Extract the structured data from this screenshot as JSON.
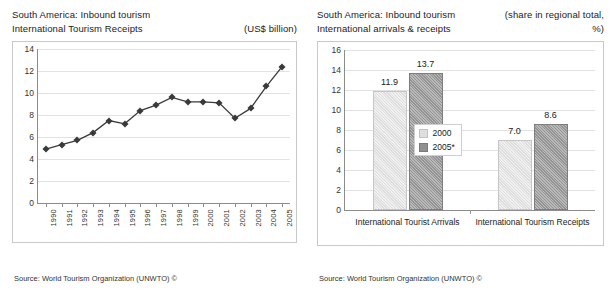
{
  "left_panel": {
    "title_line1": "South America: Inbound tourism",
    "title_line2": "International Tourism Receipts",
    "unit_note": "(US$ billion)",
    "source": "Source: World Tourism Organization (UNWTO) ©"
  },
  "right_panel": {
    "title_line1": "South America: Inbound tourism",
    "title_line2": "International arrivals & receipts",
    "unit_note_line1": "(share in regional total,",
    "unit_note_line2": "%)",
    "source": "Source: World Tourism Organization (UNWTO) ©"
  },
  "chart_data": [
    {
      "type": "line",
      "title": "South America: Inbound tourism — International Tourism Receipts",
      "xlabel": "",
      "ylabel": "US$ billion",
      "ylim": [
        0,
        14
      ],
      "yticks": [
        0,
        2,
        4,
        6,
        8,
        10,
        12,
        14
      ],
      "grid": true,
      "legend": "none",
      "categories": [
        "1990",
        "1991",
        "1992",
        "1993",
        "1994",
        "1995",
        "1996",
        "1997",
        "1998",
        "1999",
        "2000",
        "2001",
        "2002",
        "2003",
        "2004",
        "2005"
      ],
      "values": [
        4.9,
        5.3,
        5.7,
        6.4,
        7.5,
        7.2,
        8.4,
        8.9,
        9.6,
        9.2,
        9.2,
        9.1,
        7.7,
        8.6,
        10.6,
        12.4
      ]
    },
    {
      "type": "bar",
      "title": "South America: Inbound tourism — International arrivals & receipts",
      "xlabel": "",
      "ylabel": "share in regional total, %",
      "ylim": [
        0,
        16
      ],
      "yticks": [
        0,
        2,
        4,
        6,
        8,
        10,
        12,
        14,
        16
      ],
      "grid": true,
      "legend": "inside-left",
      "categories": [
        "International Tourist Arrivals",
        "International Tourism Receipts"
      ],
      "series": [
        {
          "name": "2000",
          "values": [
            11.9,
            7.0
          ],
          "color": "#dedede"
        },
        {
          "name": "2005*",
          "values": [
            13.7,
            8.6
          ],
          "color": "#8f8f8f"
        }
      ]
    }
  ]
}
